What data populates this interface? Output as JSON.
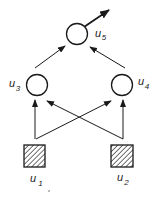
{
  "diagram": {
    "type": "neural-network",
    "colors": {
      "stroke": "#1a1a1a",
      "hatch": "#333333",
      "background": "#ffffff"
    },
    "nodes": [
      {
        "id": "u1",
        "kind": "input",
        "shape": "hatched-square",
        "label": "u",
        "subscript": "1"
      },
      {
        "id": "u2",
        "kind": "input",
        "shape": "hatched-square",
        "label": "u",
        "subscript": "2"
      },
      {
        "id": "u3",
        "kind": "hidden",
        "shape": "circle",
        "label": "u",
        "subscript": "3"
      },
      {
        "id": "u4",
        "kind": "hidden",
        "shape": "circle",
        "label": "u",
        "subscript": "4"
      },
      {
        "id": "u5",
        "kind": "output",
        "shape": "circle",
        "label": "u",
        "subscript": "5"
      }
    ],
    "edges": [
      {
        "from": "u1",
        "to": "u3"
      },
      {
        "from": "u1",
        "to": "u4"
      },
      {
        "from": "u2",
        "to": "u3"
      },
      {
        "from": "u2",
        "to": "u4"
      },
      {
        "from": "u3",
        "to": "u5"
      },
      {
        "from": "u4",
        "to": "u5"
      },
      {
        "from": "u5",
        "to": "output"
      }
    ]
  }
}
